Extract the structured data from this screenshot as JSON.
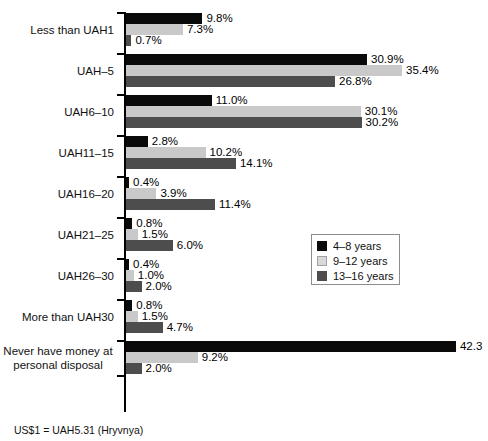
{
  "chart_data": {
    "type": "bar",
    "orientation": "horizontal",
    "title": "",
    "subtitle": "",
    "xlabel": "",
    "ylabel": "",
    "grid": false,
    "xlim": [
      0,
      45
    ],
    "legend_position": "middle-right",
    "categories": [
      "Less than UAH1",
      "UAH–5",
      "UAH6–10",
      "UAH11–15",
      "UAH16–20",
      "UAH21–25",
      "UAH26–30",
      "More than UAH30",
      "Never have money at\npersonal disposal"
    ],
    "series": [
      {
        "name": "4–8 years",
        "color": "#0a0a0a",
        "values": [
          9.8,
          30.9,
          11.0,
          2.8,
          0.4,
          0.8,
          0.4,
          0.8,
          42.3
        ],
        "labels": [
          "9.8%",
          "30.9%",
          "11.0%",
          "2.8%",
          "0.4%",
          "0.8%",
          "0.4%",
          "0.8%",
          "42.3"
        ]
      },
      {
        "name": "9–12 years",
        "color": "#c9c9c9",
        "values": [
          7.3,
          35.4,
          30.1,
          10.2,
          3.9,
          1.5,
          1.0,
          1.5,
          9.2
        ],
        "labels": [
          "7.3%",
          "35.4%",
          "30.1%",
          "10.2%",
          "3.9%",
          "1.5%",
          "1.0%",
          "1.5%",
          "9.2%"
        ]
      },
      {
        "name": "13–16 years",
        "color": "#4d4d4d",
        "values": [
          0.7,
          26.8,
          30.2,
          14.1,
          11.4,
          6.0,
          2.0,
          4.7,
          2.0
        ],
        "labels": [
          "0.7%",
          "26.8%",
          "30.2%",
          "14.1%",
          "11.4%",
          "6.0%",
          "2.0%",
          "4.7%",
          "2.0%"
        ]
      }
    ],
    "annotations": [
      "US$1 = UAH5.31 (Hryvnya)"
    ]
  },
  "legend": {
    "items": [
      {
        "label": "4–8 years"
      },
      {
        "label": "9–12 years"
      },
      {
        "label": "13–16 years"
      }
    ]
  },
  "footnote": {
    "text": "US$1 = UAH5.31 (Hryvnya)"
  },
  "axis": {
    "px_per_percent": 7.8
  }
}
